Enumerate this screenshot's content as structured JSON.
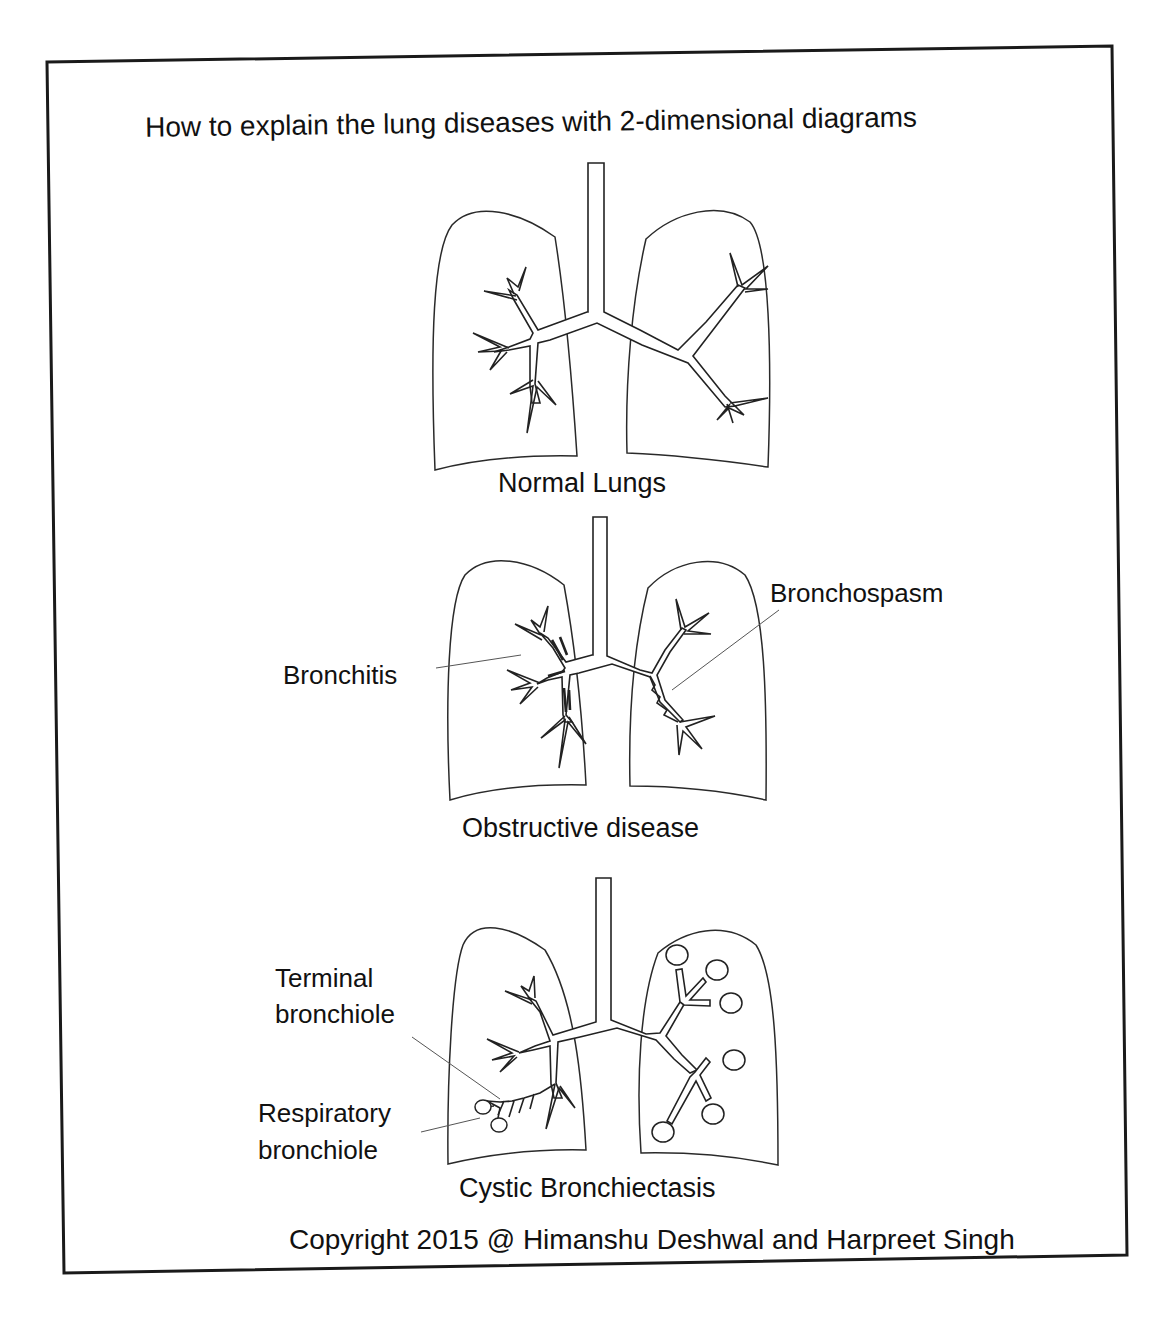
{
  "title": "How to explain the lung diseases with 2-dimensional diagrams",
  "panels": [
    {
      "caption": "Normal Lungs",
      "labels": []
    },
    {
      "caption": "Obstructive disease",
      "labels": [
        {
          "text": "Bronchitis",
          "target": "left-lung-thickened-bronchial-wall"
        },
        {
          "text": "Bronchospasm",
          "target": "right-lung-narrowed-bronchus"
        }
      ]
    },
    {
      "caption": "Cystic Bronchiectasis",
      "labels": [
        {
          "text_lines": [
            "Terminal",
            "bronchiole"
          ],
          "target": "left-lung-terminal-bronchiole"
        },
        {
          "text_lines": [
            "Respiratory",
            "bronchiole"
          ],
          "target": "left-lung-respiratory-bronchiole"
        }
      ]
    }
  ],
  "copyright": "Copyright 2015 @ Himanshu Deshwal and Harpreet Singh",
  "colors": {
    "line": "#222222",
    "background": "#ffffff",
    "frame": "#1a1a1a"
  }
}
